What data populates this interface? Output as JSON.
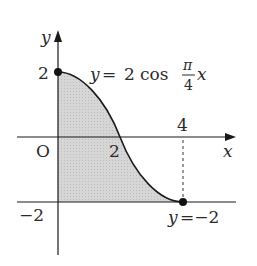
{
  "diagram": {
    "axes": {
      "x_label": "x",
      "y_label": "y",
      "origin_label": "O"
    },
    "ticks": {
      "y_top": "2",
      "y_bottom": "−2",
      "x_mid": "2",
      "x_right": "4"
    },
    "curve": {
      "equation_lhs": "y",
      "equation_eq": "=",
      "equation_coef": "2",
      "equation_func": "cos",
      "frac_num": "π",
      "frac_den": "4",
      "equation_var": "x"
    },
    "line": {
      "label_lhs": "y",
      "label_rhs": "=−2"
    },
    "colors": {
      "shade": "#d4d4d4",
      "stroke": "#1a1a1a"
    }
  }
}
